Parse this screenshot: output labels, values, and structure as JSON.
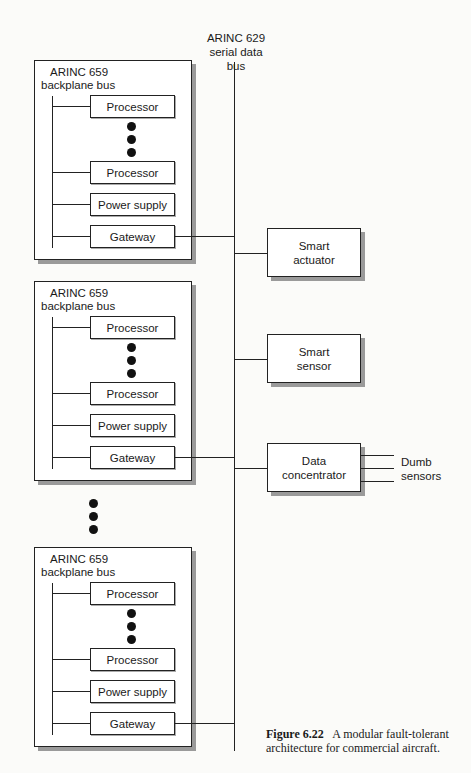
{
  "figure": {
    "number_label": "Figure 6.22",
    "caption": "A modular fault-tolerant architecture for commercial aircraft."
  },
  "serial_bus": {
    "line1": "ARINC 629",
    "line2": "serial data bus"
  },
  "modules": [
    {
      "bus_label_line1": "ARINC 659",
      "bus_label_line2": "backplane bus",
      "units": [
        "Processor",
        "Processor",
        "Power supply",
        "Gateway"
      ]
    },
    {
      "bus_label_line1": "ARINC 659",
      "bus_label_line2": "backplane bus",
      "units": [
        "Processor",
        "Processor",
        "Power supply",
        "Gateway"
      ]
    },
    {
      "bus_label_line1": "ARINC 659",
      "bus_label_line2": "backplane bus",
      "units": [
        "Processor",
        "Processor",
        "Power supply",
        "Gateway"
      ]
    }
  ],
  "devices": [
    {
      "line1": "Smart",
      "line2": "actuator"
    },
    {
      "line1": "Smart",
      "line2": "sensor"
    },
    {
      "line1": "Data",
      "line2": "concentrator"
    }
  ],
  "dumb_sensors": {
    "line1": "Dumb",
    "line2": "sensors"
  }
}
